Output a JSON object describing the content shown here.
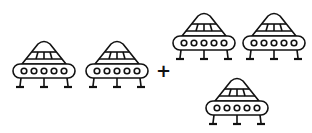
{
  "figure": {
    "operator": "+",
    "stroke_color": "#111111",
    "background": "#ffffff",
    "groups": [
      {
        "name": "left-group",
        "count": 2
      },
      {
        "name": "right-group",
        "count": 3
      }
    ],
    "ufo": {
      "windows": 5,
      "legs": 3,
      "dome_panels": 3
    }
  }
}
